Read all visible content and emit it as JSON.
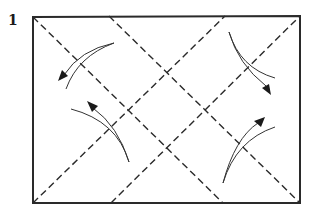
{
  "diagram": {
    "type": "origami-instruction-step",
    "step_number": "1",
    "paper": {
      "shape": "rectangle",
      "corners": {
        "top_left": [
          33,
          17
        ],
        "top_right": [
          300,
          16
        ],
        "bottom_right": [
          300,
          203
        ],
        "bottom_left": [
          33,
          203
        ]
      }
    },
    "fold_lines": [
      {
        "id": "diag-tl-to-bottom",
        "style": "dashed",
        "from": [
          33,
          17
        ],
        "to": [
          223,
          203
        ]
      },
      {
        "id": "diag-bl-to-top",
        "style": "dashed",
        "from": [
          33,
          203
        ],
        "to": [
          225,
          16
        ]
      },
      {
        "id": "diag-top-to-br",
        "style": "dashed",
        "from": [
          109,
          16
        ],
        "to": [
          300,
          203
        ]
      },
      {
        "id": "diag-bottom-to-tr",
        "style": "dashed",
        "from": [
          111,
          203
        ],
        "to": [
          300,
          16
        ]
      }
    ],
    "fold_arrows": [
      {
        "id": "arrow-top-left",
        "position": "top-left",
        "direction": "toward top-left corner"
      },
      {
        "id": "arrow-top-right",
        "position": "top-right",
        "direction": "toward right edge"
      },
      {
        "id": "arrow-bottom-left",
        "position": "bottom-left",
        "direction": "toward left edge"
      },
      {
        "id": "arrow-bottom-right",
        "position": "bottom-right",
        "direction": "toward right edge"
      }
    ],
    "colors": {
      "ink": "#2a2a2a",
      "background": "#ffffff"
    }
  }
}
